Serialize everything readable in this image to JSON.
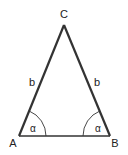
{
  "diagram": {
    "vertices": {
      "A": {
        "label": "A",
        "x": 19,
        "y": 136
      },
      "B": {
        "label": "B",
        "x": 110,
        "y": 136
      },
      "C": {
        "label": "C",
        "x": 64,
        "y": 25
      }
    },
    "sides": {
      "left": {
        "label": "b"
      },
      "right": {
        "label": "b"
      }
    },
    "angles": {
      "A": {
        "label": "α"
      },
      "B": {
        "label": "α"
      }
    },
    "colors": {
      "stroke": "#333333",
      "text": "#222222",
      "background": "#ffffff"
    }
  }
}
